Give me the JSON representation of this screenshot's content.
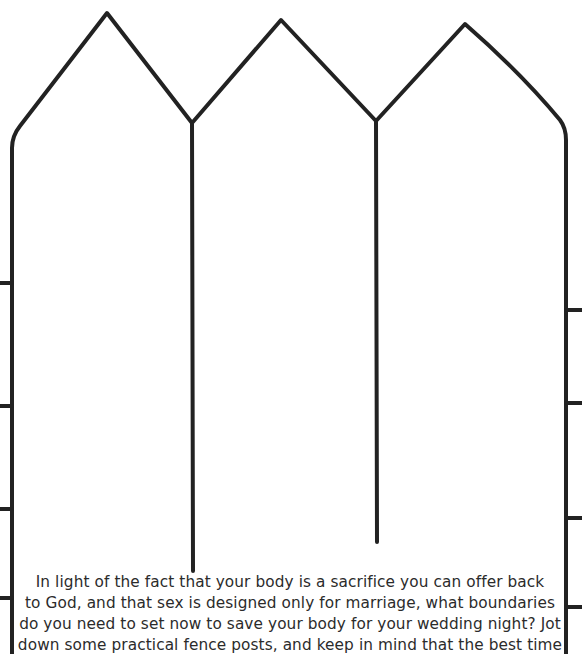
{
  "page": {
    "type": "worksheet",
    "illustration": "picket-fence-outline",
    "stroke_color": "#222222",
    "background": "#ffffff"
  },
  "fence": {
    "pickets": 3,
    "peaks": [
      [
        107,
        13
      ],
      [
        281,
        20
      ],
      [
        465,
        24
      ]
    ],
    "valleys": [
      [
        192,
        123
      ],
      [
        376,
        121
      ]
    ],
    "left_post_x": 12,
    "right_post_x": 566,
    "left_rail_ticks_y": [
      283,
      406,
      509,
      598
    ],
    "right_rail_ticks_y": [
      310,
      403,
      518,
      607
    ]
  },
  "prompt": {
    "lines": [
      "In light of the fact that your body is a sacrifice you can offer back",
      "to God, and that sex is designed only for marriage, what boundaries",
      "do you need to set now to save your body for your wedding night? Jot",
      "down some practical fence posts, and keep in mind that the best time"
    ]
  }
}
